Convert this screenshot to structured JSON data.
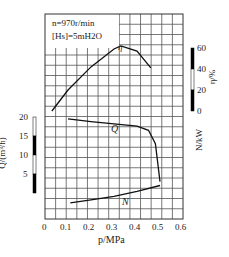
{
  "chart_data": {
    "type": "line",
    "title": "",
    "annotations": [
      "n=970r/min",
      "[Hs]=5mH2O"
    ],
    "xlabel": "p/MPa",
    "x_ticks": [
      "0",
      "0.1",
      "0.2",
      "0.3",
      "0.4",
      "0.5",
      "0.6"
    ],
    "xlim": [
      0,
      0.6
    ],
    "axes": {
      "left": {
        "label": "Q/(m³/h)",
        "ticks": [
          "20",
          "15",
          "10",
          "5"
        ],
        "range": [
          0,
          20
        ]
      },
      "right_eta": {
        "label": "η/%",
        "ticks": [
          "60",
          "40",
          "20",
          "0"
        ],
        "range": [
          0,
          60
        ]
      },
      "right_N": {
        "label": "N/kW",
        "ticks": [],
        "range": null
      }
    },
    "grid": true,
    "series": [
      {
        "name": "η",
        "axis": "right_eta",
        "x": [
          0.03,
          0.1,
          0.2,
          0.3,
          0.33,
          0.4,
          0.46
        ],
        "values": [
          0,
          20,
          42,
          59,
          62,
          57,
          41
        ]
      },
      {
        "name": "Q",
        "axis": "left",
        "x": [
          0.1,
          0.2,
          0.3,
          0.4,
          0.45,
          0.48,
          0.5
        ],
        "values": [
          19.5,
          18.8,
          18.2,
          17.6,
          16.5,
          13,
          3
        ]
      },
      {
        "name": "N",
        "axis": "right_N",
        "x": [
          0.11,
          0.2,
          0.3,
          0.4,
          0.5
        ],
        "values": [
          1.0,
          1.4,
          1.9,
          2.6,
          3.4
        ]
      }
    ]
  },
  "text": {
    "ann1": "n=970r/min",
    "ann2": "[Hs]=5mH2O",
    "xlabel": "p/MPa",
    "qlabel": "Q/(m³/h)",
    "etalabel": "η/%",
    "nlabel": "N/kW",
    "eta_curve": "η",
    "q_curve": "Q",
    "n_curve": "N"
  }
}
